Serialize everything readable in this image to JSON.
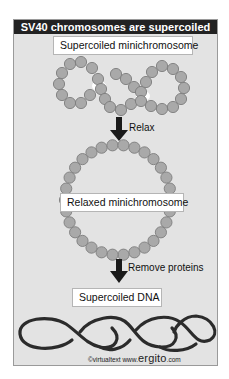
{
  "figure": {
    "title": "SV40 chromosomes are supercoiled",
    "stages": [
      {
        "label": "Supercoiled minichromosome"
      },
      {
        "label": "Relaxed minichromosome"
      },
      {
        "label": "Supercoiled DNA"
      }
    ],
    "steps": [
      {
        "label": "Relax"
      },
      {
        "label": "Remove proteins"
      }
    ],
    "credit": {
      "prefix": "©virtualtext  www.",
      "brand": "ergito",
      "suffix": ".com"
    },
    "colors": {
      "panel_background": "#e3e3e3",
      "title_bar": "#222222",
      "bead_fill": "#a9a9a9",
      "bead_outline": "#7a7a7a",
      "dna_strand": "#2b2b2b",
      "arrow": "#1a1a1a"
    }
  }
}
